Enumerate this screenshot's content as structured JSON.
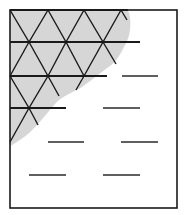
{
  "diagram": {
    "colors": {
      "background": "#ffffff",
      "frame": "#1a1a1a",
      "shade": "#d6d6d6",
      "lattice": "#1a1a1a",
      "dash": "#2a2a2a"
    },
    "frame": {
      "x": 10,
      "y": 10,
      "width": 167,
      "height": 198
    },
    "shaded_region": {
      "path": "M10,10 L128,10 C132,20 131,35 125,45 C120,55 116,62 110,66 C100,73 92,80 82,87 C72,93 62,96 55,104 C46,114 38,125 28,134 C20,140 14,144 10,146 Z"
    },
    "lattice_rows": [
      {
        "y": 10,
        "x1": 10,
        "x2": 128
      },
      {
        "y": 42,
        "x1": 10,
        "x2": 140
      },
      {
        "y": 76,
        "x1": 10,
        "x2": 107
      },
      {
        "y": 108,
        "x1": 10,
        "x2": 66
      }
    ],
    "lattice_diagonals": [
      {
        "x1": 10,
        "y1": 10,
        "x2": 29,
        "y2": 42
      },
      {
        "x1": 48,
        "y1": 10,
        "x2": 29,
        "y2": 42
      },
      {
        "x1": 48,
        "y1": 10,
        "x2": 66,
        "y2": 42
      },
      {
        "x1": 84,
        "y1": 10,
        "x2": 66,
        "y2": 42
      },
      {
        "x1": 84,
        "y1": 10,
        "x2": 103,
        "y2": 42
      },
      {
        "x1": 121,
        "y1": 10,
        "x2": 103,
        "y2": 42
      },
      {
        "x1": 121,
        "y1": 10,
        "x2": 127,
        "y2": 20
      },
      {
        "x1": 29,
        "y1": 42,
        "x2": 10,
        "y2": 76
      },
      {
        "x1": 29,
        "y1": 42,
        "x2": 48,
        "y2": 76
      },
      {
        "x1": 66,
        "y1": 42,
        "x2": 48,
        "y2": 76
      },
      {
        "x1": 66,
        "y1": 42,
        "x2": 84,
        "y2": 76
      },
      {
        "x1": 103,
        "y1": 42,
        "x2": 84,
        "y2": 76
      },
      {
        "x1": 103,
        "y1": 42,
        "x2": 116,
        "y2": 64
      },
      {
        "x1": 10,
        "y1": 76,
        "x2": 29,
        "y2": 108
      },
      {
        "x1": 48,
        "y1": 76,
        "x2": 29,
        "y2": 108
      },
      {
        "x1": 48,
        "y1": 76,
        "x2": 59,
        "y2": 96
      },
      {
        "x1": 84,
        "y1": 76,
        "x2": 76,
        "y2": 90
      },
      {
        "x1": 29,
        "y1": 108,
        "x2": 10,
        "y2": 142
      },
      {
        "x1": 29,
        "y1": 108,
        "x2": 38,
        "y2": 125
      }
    ],
    "dashes": [
      {
        "y": 76,
        "x1": 122,
        "x2": 158
      },
      {
        "y": 108,
        "x1": 103,
        "x2": 140
      },
      {
        "y": 142,
        "x1": 48,
        "x2": 84
      },
      {
        "y": 142,
        "x1": 121,
        "x2": 158
      },
      {
        "y": 175,
        "x1": 29,
        "x2": 66
      },
      {
        "y": 175,
        "x1": 103,
        "x2": 140
      }
    ]
  }
}
